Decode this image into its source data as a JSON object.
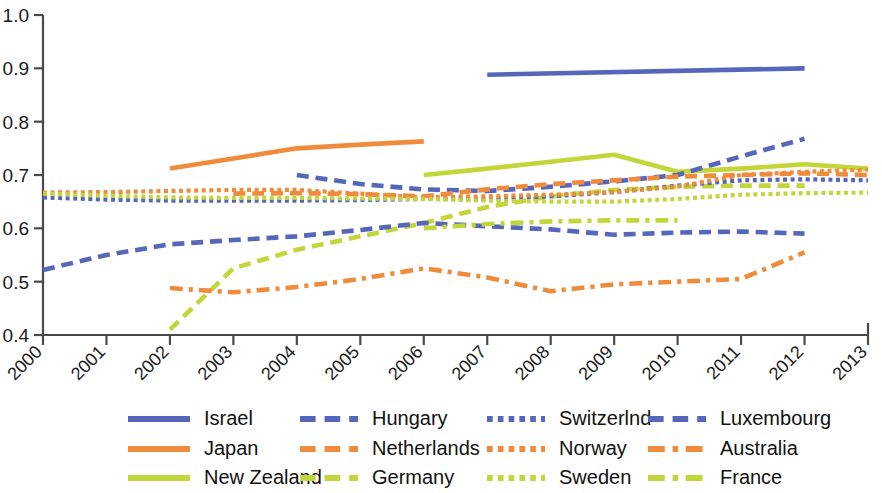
{
  "chart_data": {
    "type": "line",
    "title": "",
    "subtitle": "",
    "xlabel": "",
    "ylabel": "",
    "grid": false,
    "legend_position": "bottom",
    "x": [
      2000,
      2001,
      2002,
      2003,
      2004,
      2005,
      2006,
      2007,
      2008,
      2009,
      2010,
      2011,
      2012,
      2013
    ],
    "xtick_labels": [
      "2000",
      "2001",
      "2002",
      "2003",
      "2004",
      "2005",
      "2006",
      "2007",
      "2008",
      "2009",
      "2010",
      "2011",
      "2012",
      "2013"
    ],
    "ytick_labels": [
      "0.4",
      "0.5",
      "0.6",
      "0.7",
      "0.8",
      "0.9",
      "1.0"
    ],
    "ytick_values": [
      0.4,
      0.5,
      0.6,
      0.7,
      0.8,
      0.9,
      1.0
    ],
    "ylim": [
      0.4,
      1.0
    ],
    "xlim": [
      2000,
      2013
    ],
    "colors": {
      "blue": "#5566bb",
      "orange": "#f08b3c",
      "green": "#c2d63a"
    },
    "series": [
      {
        "name": "Israel",
        "color": "#5566bb",
        "style": "solid",
        "x": [
          2007,
          2012
        ],
        "values": [
          0.888,
          0.9
        ]
      },
      {
        "name": "Japan",
        "color": "#f08b3c",
        "style": "solid",
        "x": [
          2002,
          2003,
          2004,
          2005,
          2006
        ],
        "values": [
          0.712,
          0.731,
          0.75,
          0.757,
          0.763
        ]
      },
      {
        "name": "New Zealand",
        "color": "#c2d63a",
        "style": "solid",
        "x": [
          2006,
          2007,
          2008,
          2009,
          2010,
          2011,
          2012,
          2013
        ],
        "values": [
          0.7,
          0.712,
          0.725,
          0.738,
          0.706,
          0.712,
          0.72,
          0.712
        ]
      },
      {
        "name": "Hungary",
        "color": "#5566bb",
        "style": "dashed",
        "x": [
          2004,
          2005,
          2006,
          2007,
          2008,
          2009,
          2010,
          2011,
          2012
        ],
        "values": [
          0.7,
          0.683,
          0.673,
          0.67,
          0.678,
          0.688,
          0.7,
          0.735,
          0.768
        ]
      },
      {
        "name": "Netherlands",
        "color": "#f08b3c",
        "style": "dashed",
        "x": [
          2003,
          2004,
          2005,
          2006,
          2007,
          2008,
          2009,
          2010,
          2011,
          2012,
          2013
        ],
        "values": [
          0.665,
          0.666,
          0.664,
          0.66,
          0.673,
          0.683,
          0.69,
          0.697,
          0.7,
          0.703,
          0.7
        ]
      },
      {
        "name": "Germany",
        "color": "#c2d63a",
        "style": "dashed",
        "x": [
          2002,
          2003,
          2004,
          2005,
          2006,
          2007,
          2008,
          2009,
          2010,
          2011,
          2012
        ],
        "values": [
          0.41,
          0.525,
          0.56,
          0.585,
          0.61,
          0.64,
          0.66,
          0.672,
          0.678,
          0.68,
          0.68
        ]
      },
      {
        "name": "Switzerlnd",
        "color": "#5566bb",
        "style": "dotted",
        "x": [
          2000,
          2001,
          2002,
          2003,
          2004,
          2005,
          2006,
          2007,
          2008,
          2009,
          2010,
          2011,
          2012,
          2013
        ],
        "values": [
          0.658,
          0.654,
          0.652,
          0.652,
          0.652,
          0.653,
          0.655,
          0.655,
          0.66,
          0.668,
          0.68,
          0.69,
          0.692,
          0.69
        ]
      },
      {
        "name": "Norway",
        "color": "#f08b3c",
        "style": "dotted",
        "x": [
          2000,
          2001,
          2002,
          2003,
          2004,
          2005,
          2006,
          2007,
          2008,
          2009,
          2010,
          2011,
          2012,
          2013
        ],
        "values": [
          0.667,
          0.668,
          0.67,
          0.672,
          0.672,
          0.665,
          0.658,
          0.66,
          0.663,
          0.668,
          0.678,
          0.7,
          0.706,
          0.71
        ]
      },
      {
        "name": "Sweden",
        "color": "#c2d63a",
        "style": "dotted",
        "x": [
          2000,
          2001,
          2002,
          2003,
          2004,
          2005,
          2006,
          2007,
          2008,
          2009,
          2010,
          2011,
          2012,
          2013
        ],
        "values": [
          0.665,
          0.661,
          0.658,
          0.657,
          0.657,
          0.656,
          0.655,
          0.652,
          0.65,
          0.65,
          0.655,
          0.663,
          0.666,
          0.667
        ]
      },
      {
        "name": "Luxembourg",
        "color": "#5566bb",
        "style": "dashed",
        "x": [
          2000,
          2001,
          2002,
          2003,
          2004,
          2005,
          2006,
          2007,
          2008,
          2009,
          2010,
          2011,
          2012
        ],
        "values": [
          0.522,
          0.55,
          0.57,
          0.578,
          0.585,
          0.597,
          0.61,
          0.604,
          0.598,
          0.588,
          0.592,
          0.594,
          0.59
        ]
      },
      {
        "name": "Australia",
        "color": "#f08b3c",
        "style": "dashdot",
        "x": [
          2002,
          2003,
          2004,
          2005,
          2006,
          2007,
          2008,
          2009,
          2010,
          2011,
          2012
        ],
        "values": [
          0.488,
          0.48,
          0.49,
          0.505,
          0.525,
          0.508,
          0.482,
          0.495,
          0.5,
          0.505,
          0.555
        ]
      },
      {
        "name": "France",
        "color": "#c2d63a",
        "style": "dashdot",
        "x": [
          2006,
          2007,
          2008,
          2009,
          2010
        ],
        "values": [
          0.6,
          0.608,
          0.613,
          0.615,
          0.615
        ]
      }
    ]
  },
  "legend": {
    "columns": [
      [
        {
          "label": "Israel",
          "color": "#5566bb",
          "style": "solid"
        },
        {
          "label": "Japan",
          "color": "#f08b3c",
          "style": "solid"
        },
        {
          "label": "New Zealand",
          "color": "#c2d63a",
          "style": "solid"
        }
      ],
      [
        {
          "label": "Hungary",
          "color": "#5566bb",
          "style": "dashed"
        },
        {
          "label": "Netherlands",
          "color": "#f08b3c",
          "style": "dashed"
        },
        {
          "label": "Germany",
          "color": "#c2d63a",
          "style": "dashed"
        }
      ],
      [
        {
          "label": "Switzerlnd",
          "color": "#5566bb",
          "style": "dotted"
        },
        {
          "label": "Norway",
          "color": "#f08b3c",
          "style": "dotted"
        },
        {
          "label": "Sweden",
          "color": "#c2d63a",
          "style": "dotted"
        }
      ],
      [
        {
          "label": "Luxembourg",
          "color": "#5566bb",
          "style": "dashed"
        },
        {
          "label": "Australia",
          "color": "#f08b3c",
          "style": "dashdot"
        },
        {
          "label": "France",
          "color": "#c2d63a",
          "style": "dashdot"
        }
      ]
    ]
  }
}
